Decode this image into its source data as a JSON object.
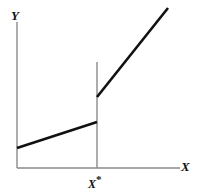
{
  "figure": {
    "width": 197,
    "height": 195,
    "background": "#ffffff"
  },
  "labels": {
    "y_axis": "Y",
    "x_axis": "X",
    "threshold_base": "X",
    "threshold_star": "*",
    "threshold_full": "X*"
  },
  "colors": {
    "axis": "#8a8a8a",
    "data_line": "#111111",
    "marker": "#8a8a8a",
    "background": "#ffffff"
  },
  "chart_data": {
    "type": "line",
    "title": "",
    "subtitle": "",
    "xlabel": "X",
    "ylabel": "Y",
    "xlim": [
      0,
      1
    ],
    "ylim": [
      0,
      1
    ],
    "grid": false,
    "legend": null,
    "annotations": [
      {
        "text": "X*",
        "role": "threshold-tick-label",
        "x": 0.49,
        "y": 0
      }
    ],
    "reference_lines": [
      {
        "name": "threshold-vertical-line",
        "orientation": "vertical",
        "x": 0.49,
        "y_from": 0.0,
        "y_to": 0.73,
        "style": "solid",
        "color": "#8a8a8a"
      }
    ],
    "series": [
      {
        "name": "segment-below-threshold",
        "type": "line",
        "x": [
          0.0,
          0.49
        ],
        "y": [
          0.137,
          0.315
        ],
        "slope": "shallow-positive",
        "color": "#111111"
      },
      {
        "name": "segment-above-threshold",
        "type": "line",
        "x": [
          0.49,
          0.926
        ],
        "y": [
          0.486,
          1.096
        ],
        "slope": "steep-positive",
        "color": "#111111"
      }
    ],
    "discontinuity": {
      "at_x": 0.49,
      "y_left_limit": 0.315,
      "y_right_limit": 0.486,
      "jump_size": 0.171,
      "direction": "upward"
    }
  },
  "geometry": {
    "origin": {
      "x": 17,
      "y": 168
    },
    "y_axis_top": {
      "x": 17,
      "y": 22
    },
    "x_axis_right": {
      "x": 180,
      "y": 168
    },
    "threshold_x": 97,
    "threshold_line_top_y": 62,
    "lower_segment": {
      "x1": 17,
      "y1": 148,
      "x2": 97,
      "y2": 122
    },
    "upper_segment": {
      "x1": 97,
      "y1": 97,
      "x2": 168,
      "y2": 8
    }
  }
}
